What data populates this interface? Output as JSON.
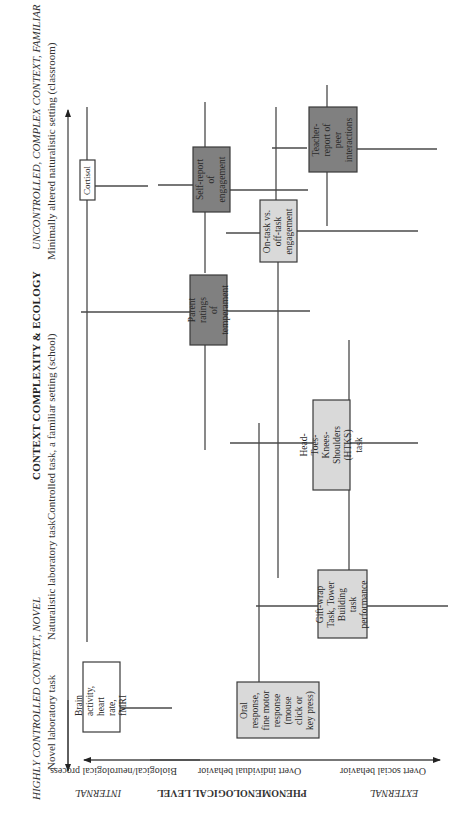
{
  "context_axis": {
    "title": "CONTEXT COMPLEXITY & ECOLOGY",
    "low_end": "HIGHLY CONTROLLED CONTEXT, NOVEL",
    "high_end": "UNCONTROLLED, COMPLEX CONTEXT, FAMILIAR",
    "levels": [
      "Novel laboratory task",
      "Naturalistic laboratory task",
      "Controlled task, a familiar setting (school)",
      "Minimally altered naturalistic setting (classroom)"
    ]
  },
  "phenomenological_axis": {
    "title": "PHENOMENOLOGICAL LEVEL",
    "low_end": "INTERNAL",
    "high_end": "EXTERNAL",
    "levels": [
      "Biological/neurological process",
      "Overt individual behavior",
      "Overt social behavior"
    ]
  },
  "boxes": {
    "cortisol": "Cortisol",
    "brain": "Brain\nactivity, heart\nrate, fMRI",
    "oral": "Oral\nresponse,\nfine motor\nresponse\n(mouse\nclick or\nkey press)",
    "giftwrap": "Gift-wrap\nTask, Tower\nBuilding task\nperformance",
    "htks": "Head-Toes-\nKnees-Shoulders\n(HTKS) task",
    "parent": "Parent ratings\nof\ntemperament",
    "selfreport": "Self-report\nof\nengagement",
    "ontask": "On-task vs.\noff-task\nengagement",
    "teacher": "Teacher-\nreport of\npeer\ninteractions"
  },
  "colors": {
    "white_box": "#ffffff",
    "light_box": "#d9d9d9",
    "dark_box": "#808080",
    "line": "#4a4a4a"
  }
}
